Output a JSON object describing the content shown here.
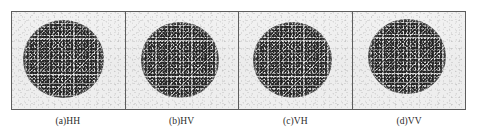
{
  "figure": {
    "name": "polarimetric-speckle-panels",
    "background_color": "#ffffff",
    "border_color": "#5d5d5d",
    "panel_background_color": "#eeeeee",
    "speckle_color": "#8d8d8d"
  },
  "panels": [
    {
      "id": "panel-hh",
      "caption": "(a)HH",
      "polarization": "HH",
      "target_shape": "circle",
      "disc": {
        "left_pct": 10.0,
        "top_pct": 8.0,
        "size_pct": 72.0
      }
    },
    {
      "id": "panel-hv",
      "caption": "(b)HV",
      "polarization": "HV",
      "target_shape": "circle",
      "disc": {
        "left_pct": 13.5,
        "top_pct": 10.5,
        "size_pct": 70.0
      }
    },
    {
      "id": "panel-vh",
      "caption": "(c)VH",
      "polarization": "VH",
      "target_shape": "circle",
      "disc": {
        "left_pct": 12.5,
        "top_pct": 10.0,
        "size_pct": 70.0
      }
    },
    {
      "id": "panel-vv",
      "caption": "(d)VV",
      "polarization": "VV",
      "target_shape": "circle",
      "disc": {
        "left_pct": 14.0,
        "top_pct": 7.0,
        "size_pct": 69.0
      }
    }
  ]
}
